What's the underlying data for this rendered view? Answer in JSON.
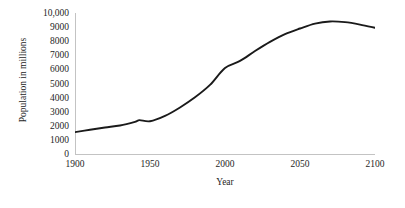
{
  "chart_data": {
    "type": "line",
    "title": "",
    "subtitle": "",
    "xlabel": "Year",
    "ylabel": "Population in millions",
    "xlim": [
      1900,
      2100
    ],
    "ylim": [
      0,
      10000
    ],
    "grid": false,
    "legend": null,
    "legend_position": "none",
    "annotations": [],
    "x_tick_labels": [
      "1900",
      "1950",
      "2000",
      "2050",
      "2100"
    ],
    "x_ticks": [
      1900,
      1950,
      2000,
      2050,
      2100
    ],
    "y_tick_labels": [
      "0",
      "1000",
      "2000",
      "3000",
      "4000",
      "5000",
      "6000",
      "7000",
      "8000",
      "9000",
      "10,000"
    ],
    "y_ticks": [
      0,
      1000,
      2000,
      3000,
      4000,
      5000,
      6000,
      7000,
      8000,
      9000,
      10000
    ],
    "series": [
      {
        "name": "World population",
        "color": "#1a1a1a",
        "line_width": 1.9,
        "x": [
          1900,
          1910,
          1920,
          1930,
          1940,
          1943,
          1950,
          1960,
          1970,
          1980,
          1990,
          2000,
          2010,
          2020,
          2030,
          2040,
          2050,
          2060,
          2070,
          2080,
          2090,
          2100
        ],
        "values": [
          1550,
          1720,
          1880,
          2020,
          2280,
          2400,
          2320,
          2700,
          3300,
          4020,
          4900,
          6100,
          6600,
          7300,
          7950,
          8500,
          8900,
          9250,
          9400,
          9350,
          9180,
          8950
        ]
      }
    ]
  },
  "axes": {
    "axis_color": "#c3c3c3",
    "text_color": "#262626"
  }
}
